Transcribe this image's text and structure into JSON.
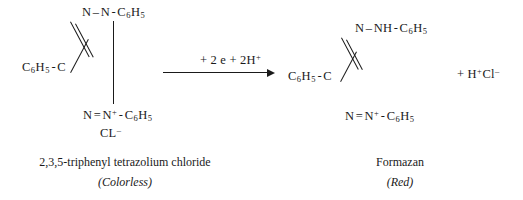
{
  "figure": {
    "type": "chemical-reaction-scheme",
    "background_color": "#ffffff",
    "text_color": "#1a1a1a"
  },
  "reactant": {
    "name_caption": "2,3,5-triphenyl tetrazolium chloride",
    "state_caption": "(Colorless)",
    "top_fragment": {
      "n1": "N",
      "bond": "–",
      "n2": "N",
      "dash": "-",
      "phenyl": "C",
      "phenyl_sub1": "6",
      "phenyl_h": "H",
      "phenyl_sub2": "5"
    },
    "left_fragment": {
      "phenyl": "C",
      "phenyl_sub1": "6",
      "phenyl_h": "H",
      "phenyl_sub2": "5",
      "dash": "-",
      "carbon": "C"
    },
    "bottom_fragment": {
      "n1": "N",
      "bond": "=",
      "n2": "N",
      "charge": "+",
      "dash": "-",
      "phenyl": "C",
      "phenyl_sub1": "6",
      "phenyl_h": "H",
      "phenyl_sub2": "5"
    },
    "counterion": {
      "label": "CL",
      "charge": "–"
    }
  },
  "arrow": {
    "reagent_label": "+ 2 e + 2H",
    "reagent_charge": "+"
  },
  "product": {
    "name_caption": "Formazan",
    "state_caption": "(Red)",
    "top_fragment": {
      "n1": "N",
      "bond": "–",
      "nh": "NH",
      "dash": "-",
      "phenyl": "C",
      "phenyl_sub1": "6",
      "phenyl_h": "H",
      "phenyl_sub2": "5"
    },
    "left_fragment": {
      "phenyl": "C",
      "phenyl_sub1": "6",
      "phenyl_h": "H",
      "phenyl_sub2": "5",
      "dash": "-",
      "carbon": "C"
    },
    "bottom_fragment": {
      "n1": "N",
      "bond": "=",
      "n2": "N",
      "charge": "+",
      "dash": "-",
      "phenyl": "C",
      "phenyl_sub1": "6",
      "phenyl_h": "H",
      "phenyl_sub2": "5"
    }
  },
  "byproduct": {
    "plus": "+ H",
    "h_charge": "+",
    "cl": "Cl",
    "cl_charge": "–"
  }
}
